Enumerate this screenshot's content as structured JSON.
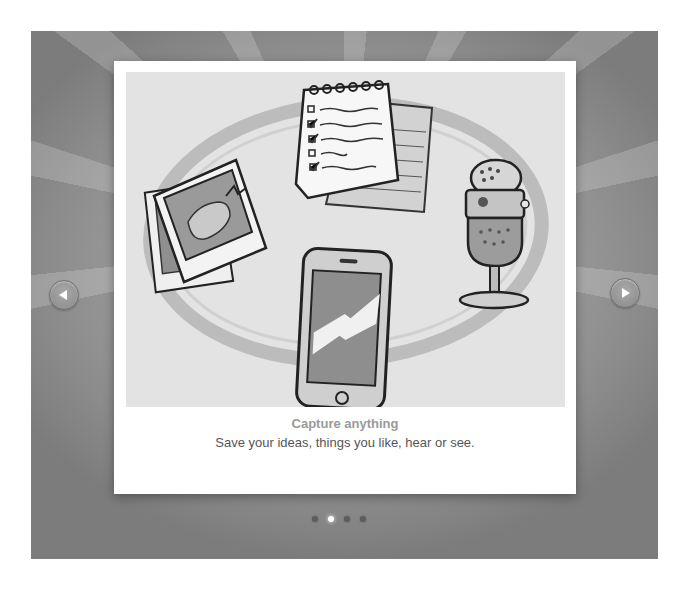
{
  "slide": {
    "title": "Capture anything",
    "subtitle": "Save your ideas, things you like, hear or see.",
    "illustration": [
      "notepad-checklist",
      "photo-stack",
      "microphone",
      "smartphone"
    ]
  },
  "navigation": {
    "prev_icon": "triangle-left",
    "next_icon": "triangle-right"
  },
  "pagination": {
    "total": 4,
    "active_index": 1
  },
  "colors": {
    "panel": "#9a9a9a",
    "card": "#ffffff",
    "title": "#9a9a9a",
    "subtitle": "#555555",
    "dot_inactive": "#5d5d5d",
    "dot_active": "#ffffff"
  }
}
